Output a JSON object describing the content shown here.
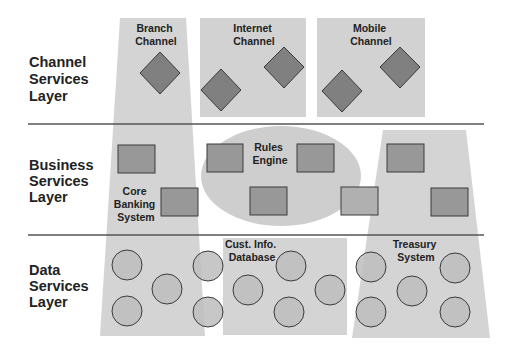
{
  "layers": [
    {
      "id": "channel",
      "lines": [
        "Channel",
        "Services",
        "Layer"
      ]
    },
    {
      "id": "business",
      "lines": [
        "Business",
        "Services",
        "Layer"
      ]
    },
    {
      "id": "data",
      "lines": [
        "Data",
        "Services",
        "Layer"
      ]
    }
  ],
  "components": {
    "branch": {
      "lines": [
        "Branch",
        "Channel"
      ]
    },
    "internet": {
      "lines": [
        "Internet",
        "Channel"
      ]
    },
    "mobile": {
      "lines": [
        "Mobile",
        "Channel"
      ]
    },
    "rules": {
      "lines": [
        "Rules",
        "Engine"
      ]
    },
    "core": {
      "lines": [
        "Core",
        "Banking",
        "System"
      ]
    },
    "custdb": {
      "lines": [
        "Cust. Info.",
        "Database"
      ]
    },
    "treasury": {
      "lines": [
        "Treasury",
        "System"
      ]
    }
  },
  "colors": {
    "panel": "#cfcfcf",
    "ellipse": "#c6c6c6",
    "shape": "#808080",
    "rect": "#9a9a9a",
    "circle": "#bdbdbd",
    "line": "#555555"
  }
}
